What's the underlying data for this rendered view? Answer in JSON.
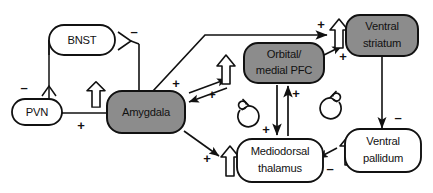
{
  "diagram": {
    "colors": {
      "filled_node_fill": "#8c8c8c",
      "open_node_fill": "#ffffff",
      "stroke": "#111111",
      "background": "#ffffff"
    },
    "nodes": [
      {
        "id": "bnst",
        "label_lines": [
          "BNST"
        ],
        "style": "open",
        "x": 82,
        "y": 40,
        "w": 66,
        "h": 30
      },
      {
        "id": "pvn",
        "label_lines": [
          "PVN"
        ],
        "style": "open",
        "x": 37,
        "y": 112,
        "w": 50,
        "h": 26
      },
      {
        "id": "amygdala",
        "label_lines": [
          "Amygdala"
        ],
        "style": "filled",
        "x": 146,
        "y": 112,
        "w": 78,
        "h": 42
      },
      {
        "id": "orbital_pfc",
        "label_lines": [
          "Orbital/",
          "medial PFC"
        ],
        "style": "filled",
        "x": 284,
        "y": 63,
        "w": 80,
        "h": 40
      },
      {
        "id": "ventral_striatum",
        "label_lines": [
          "Ventral",
          "striatum"
        ],
        "style": "filled",
        "x": 382,
        "y": 35,
        "w": 72,
        "h": 40
      },
      {
        "id": "mediodorsal",
        "label_lines": [
          "Mediodorsal",
          "thalamus"
        ],
        "style": "open",
        "x": 280,
        "y": 160,
        "w": 86,
        "h": 42
      },
      {
        "id": "ventral_pallidum",
        "label_lines": [
          "Ventral",
          "pallidum"
        ],
        "style": "open",
        "x": 383,
        "y": 152,
        "w": 76,
        "h": 40
      }
    ],
    "signs": [
      {
        "id": "sign-bnst-out",
        "text": "–",
        "x": 134,
        "y": 33
      },
      {
        "id": "sign-bnst-to-pvn",
        "text": "–",
        "x": 24,
        "y": 89
      },
      {
        "id": "sign-amyg-to-pvn",
        "text": "+",
        "x": 81,
        "y": 125
      },
      {
        "id": "sign-amyg-to-vs",
        "text": "+",
        "x": 320,
        "y": 25
      },
      {
        "id": "sign-amyg-to-pfc",
        "text": "+",
        "x": 175,
        "y": 85
      },
      {
        "id": "sign-pfc-to-amyg",
        "text": "+",
        "x": 212,
        "y": 95
      },
      {
        "id": "sign-pfc-to-vs",
        "text": "+",
        "x": 341,
        "y": 58
      },
      {
        "id": "sign-pfc-to-md",
        "text": "+",
        "x": 265,
        "y": 131
      },
      {
        "id": "sign-md-to-pfc",
        "text": "+",
        "x": 287,
        "y": 98
      },
      {
        "id": "sign-amyg-to-md",
        "text": "+",
        "x": 205,
        "y": 158
      },
      {
        "id": "sign-vs-to-vp",
        "text": "–",
        "x": 397,
        "y": 117
      },
      {
        "id": "sign-vp-to-md",
        "text": "–",
        "x": 328,
        "y": 168
      }
    ],
    "legend_symbols": [
      {
        "id": "hollow-up-arrow",
        "meaning": "increased-activity-open-arrow"
      },
      {
        "id": "loop-clockwise",
        "meaning": "recurrent-loop"
      }
    ]
  }
}
